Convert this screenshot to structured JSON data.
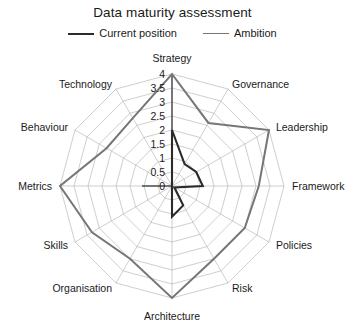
{
  "chart": {
    "title": "Data maturity assessment",
    "legend": [
      {
        "label": "Current position",
        "color": "#2b2b2b"
      },
      {
        "label": "Ambition",
        "color": "#767676"
      }
    ]
  },
  "chart_data": {
    "type": "radar",
    "title": "Data maturity assessment",
    "xlabel": "",
    "ylabel": "",
    "categories": [
      "Strategy",
      "Governance",
      "Leadership",
      "Framework",
      "Policies",
      "Risk",
      "Architecture",
      "Organisation",
      "Skills",
      "Metrics",
      "Behaviour",
      "Technology"
    ],
    "tick_labels": [
      "0",
      "0.5",
      "1",
      "1.5",
      "2",
      "2.5",
      "3",
      "3.5",
      "4"
    ],
    "tick_values": [
      0,
      0.5,
      1,
      1.5,
      2,
      2.5,
      3,
      3.5,
      4
    ],
    "rlim": [
      0,
      4
    ],
    "grid": true,
    "legend_position": "top",
    "series": [
      {
        "name": "Current position",
        "color": "#2b2b2b",
        "values": [
          2,
          0.9,
          1,
          1.1,
          0.1,
          0.8,
          1.1,
          0,
          0,
          0,
          0,
          0
        ]
      },
      {
        "name": "Ambition",
        "color": "#767676",
        "values": [
          4,
          2.6,
          4,
          3.1,
          3,
          3,
          4,
          3,
          3.3,
          4,
          2.7,
          2.8
        ]
      }
    ]
  }
}
